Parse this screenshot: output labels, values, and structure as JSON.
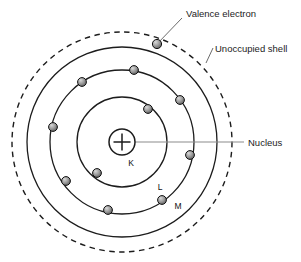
{
  "figure": {
    "center": {
      "x": 122,
      "y": 142
    }
  },
  "colors": {
    "stroke": "#1c1c1c",
    "electron_fill": "#8a8a8a",
    "electron_stroke": "#111111",
    "electron_highlight": "#d8d8d8",
    "leader_line": "#6b6b6b",
    "nucleus_line": "#8c8c8c",
    "background": "#ffffff",
    "text": "#1c1c1c"
  },
  "annotations": [
    {
      "name": "valence-electron",
      "label": "Valence electron",
      "text_x": 186,
      "text_y": 14
    },
    {
      "name": "unoccupied-shell",
      "label": "Unoccupied shell",
      "text_x": 214,
      "text_y": 51
    },
    {
      "name": "nucleus",
      "label": "Nucleus",
      "text_x": 248,
      "text_y": 141
    }
  ],
  "shell_labels": [
    {
      "name": "shell-label-k",
      "label": "K",
      "x": 131,
      "y": 166
    },
    {
      "name": "shell-label-l",
      "label": "L",
      "x": 160,
      "y": 190
    },
    {
      "name": "shell-label-m",
      "label": "M",
      "x": 178,
      "y": 209
    }
  ],
  "nucleus": {
    "charge_symbol": "+",
    "radius": 13,
    "cx": 122,
    "cy": 142
  },
  "shells": [
    {
      "name": "k-shell",
      "label": "K",
      "radius": 45,
      "style": "solid",
      "electron_count": 2
    },
    {
      "name": "l-shell",
      "label": "L",
      "radius": 72,
      "style": "solid",
      "electron_count": 8
    },
    {
      "name": "m-shell",
      "label": "M",
      "radius": 95,
      "style": "solid",
      "electron_count": 1
    },
    {
      "name": "unoccupied-shell",
      "label": "Unoccupied shell",
      "radius": 110,
      "style": "dashed",
      "electron_count": 0
    }
  ],
  "electrons": [
    {
      "id": 1,
      "shell": "K",
      "x": 148,
      "y": 109,
      "r": 4.4
    },
    {
      "id": 2,
      "shell": "K",
      "x": 97,
      "y": 173,
      "r": 4.4
    },
    {
      "id": 3,
      "shell": "L",
      "x": 134,
      "y": 70,
      "r": 4.4
    },
    {
      "id": 4,
      "shell": "L",
      "x": 82,
      "y": 82,
      "r": 4.4
    },
    {
      "id": 5,
      "shell": "L",
      "x": 180,
      "y": 100,
      "r": 4.4
    },
    {
      "id": 6,
      "shell": "L",
      "x": 53,
      "y": 127,
      "r": 4.4
    },
    {
      "id": 7,
      "shell": "L",
      "x": 190,
      "y": 155,
      "r": 4.4
    },
    {
      "id": 8,
      "shell": "L",
      "x": 66,
      "y": 181,
      "r": 4.4
    },
    {
      "id": 9,
      "shell": "L",
      "x": 108,
      "y": 210,
      "r": 4.4
    },
    {
      "id": 10,
      "shell": "L",
      "x": 162,
      "y": 200,
      "r": 4.4
    },
    {
      "id": 11,
      "shell": "M",
      "x": 157,
      "y": 44,
      "r": 4.4
    }
  ],
  "leaders": {
    "valence": {
      "x1": 157,
      "y1": 44,
      "x2": 182,
      "y2": 18
    },
    "unoccupied": {
      "x1": 206,
      "y1": 62,
      "x2": 212,
      "y2": 48
    },
    "nucleus": {
      "x1": 128,
      "y1": 142,
      "x2": 244,
      "y2": 142
    }
  },
  "caption": {
    "text": ""
  }
}
